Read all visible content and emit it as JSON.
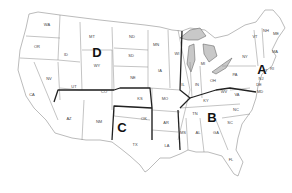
{
  "map": {
    "title": "United States regions map",
    "regions": [
      {
        "letter": "A",
        "x": 262,
        "y": 74
      },
      {
        "letter": "B",
        "x": 212,
        "y": 122
      },
      {
        "letter": "C",
        "x": 122,
        "y": 132
      },
      {
        "letter": "D",
        "x": 97,
        "y": 57
      }
    ],
    "states": [
      {
        "abbr": "WA",
        "x": 47,
        "y": 26
      },
      {
        "abbr": "OR",
        "x": 37,
        "y": 48
      },
      {
        "abbr": "ID",
        "x": 66,
        "y": 56
      },
      {
        "abbr": "MT",
        "x": 92,
        "y": 38
      },
      {
        "abbr": "WY",
        "x": 97,
        "y": 67
      },
      {
        "abbr": "ND",
        "x": 132,
        "y": 38
      },
      {
        "abbr": "SD",
        "x": 131,
        "y": 57
      },
      {
        "abbr": "NE",
        "x": 133,
        "y": 79
      },
      {
        "abbr": "NV",
        "x": 49,
        "y": 80
      },
      {
        "abbr": "UT",
        "x": 74,
        "y": 88
      },
      {
        "abbr": "CO",
        "x": 104,
        "y": 93
      },
      {
        "abbr": "CA",
        "x": 32,
        "y": 96
      },
      {
        "abbr": "AZ",
        "x": 69,
        "y": 120
      },
      {
        "abbr": "NM",
        "x": 99,
        "y": 123
      },
      {
        "abbr": "KS",
        "x": 140,
        "y": 100
      },
      {
        "abbr": "OK",
        "x": 144,
        "y": 120
      },
      {
        "abbr": "TX",
        "x": 135,
        "y": 146
      },
      {
        "abbr": "MN",
        "x": 156,
        "y": 46
      },
      {
        "abbr": "IA",
        "x": 160,
        "y": 72
      },
      {
        "abbr": "MO",
        "x": 165,
        "y": 100
      },
      {
        "abbr": "AR",
        "x": 166,
        "y": 124
      },
      {
        "abbr": "LA",
        "x": 167,
        "y": 147
      },
      {
        "abbr": "WI",
        "x": 177,
        "y": 55
      },
      {
        "abbr": "IL",
        "x": 183,
        "y": 86
      },
      {
        "abbr": "MI",
        "x": 203,
        "y": 65
      },
      {
        "abbr": "IN",
        "x": 197,
        "y": 86
      },
      {
        "abbr": "OH",
        "x": 213,
        "y": 82
      },
      {
        "abbr": "KY",
        "x": 206,
        "y": 102
      },
      {
        "abbr": "TN",
        "x": 195,
        "y": 115
      },
      {
        "abbr": "MS",
        "x": 183,
        "y": 134
      },
      {
        "abbr": "AL",
        "x": 198,
        "y": 134
      },
      {
        "abbr": "GA",
        "x": 216,
        "y": 134
      },
      {
        "abbr": "FL",
        "x": 231,
        "y": 161
      },
      {
        "abbr": "SC",
        "x": 230,
        "y": 124
      },
      {
        "abbr": "NC",
        "x": 236,
        "y": 111
      },
      {
        "abbr": "VA",
        "x": 237,
        "y": 96
      },
      {
        "abbr": "WV",
        "x": 224,
        "y": 93
      },
      {
        "abbr": "PA",
        "x": 235,
        "y": 76
      },
      {
        "abbr": "NY",
        "x": 245,
        "y": 58
      },
      {
        "abbr": "VT",
        "x": 255,
        "y": 38
      },
      {
        "abbr": "NH",
        "x": 266,
        "y": 32
      },
      {
        "abbr": "ME",
        "x": 276,
        "y": 35
      },
      {
        "abbr": "MA",
        "x": 275,
        "y": 53
      },
      {
        "abbr": "RI",
        "x": 272,
        "y": 70
      },
      {
        "abbr": "CT",
        "x": 265,
        "y": 72
      },
      {
        "abbr": "NJ",
        "x": 261,
        "y": 80
      },
      {
        "abbr": "DE",
        "x": 259,
        "y": 86
      },
      {
        "abbr": "MD",
        "x": 260,
        "y": 93
      }
    ]
  }
}
